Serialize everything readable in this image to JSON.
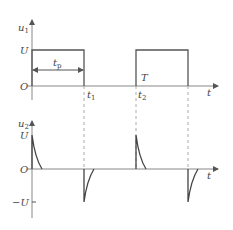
{
  "top_plot": {
    "y_label": "u",
    "y_label_sub": "1",
    "level_high": "U",
    "origin": "O",
    "pulse_width_label": "t",
    "pulse_width_sub": "p",
    "period_label": "T",
    "t1_label": "t",
    "t1_sub": "1",
    "t2_label": "t",
    "t2_sub": "2",
    "x_label": "t"
  },
  "bottom_plot": {
    "y_label": "u",
    "y_label_sub": "2",
    "level_high": "U",
    "origin": "O",
    "level_low": "−U",
    "x_label": "t"
  },
  "colors": {
    "axis": "#888888",
    "signal": "#555555",
    "dashed": "#aaaaaa"
  }
}
